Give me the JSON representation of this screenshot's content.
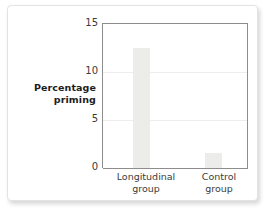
{
  "chart_data": {
    "type": "bar",
    "title": "",
    "subtitle": "",
    "xlabel": "",
    "ylabel": "Percentage priming",
    "ylabel_lines": [
      "Percentage",
      "priming"
    ],
    "categories": [
      "Longitudinal group",
      "Control group"
    ],
    "category_lines": [
      [
        "Longitudinal",
        "group"
      ],
      [
        "Control",
        "group"
      ]
    ],
    "values": [
      12.5,
      1.6
    ],
    "ylim": [
      0,
      15
    ],
    "yticks": [
      0,
      5,
      10,
      15
    ],
    "ytick_labels": [
      "0",
      "5",
      "10",
      "15"
    ],
    "grid": true,
    "gridlines_at": [
      5,
      10
    ],
    "legend": "none",
    "bar_color": "#ececea",
    "axis_color": "#8d8d8d",
    "gridline_color": "#ededed",
    "text_color": "#3b3b3b",
    "title_color": "#1c1c1c"
  }
}
